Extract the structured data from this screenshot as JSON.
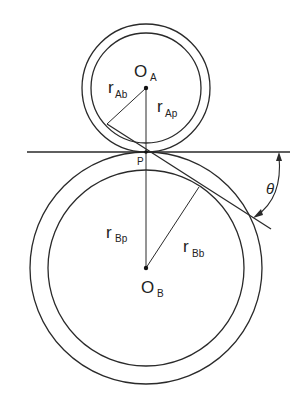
{
  "diagram": {
    "gear_a": {
      "center_label": "O",
      "center_sub": "A",
      "base_radius_label": "r",
      "base_radius_sub": "Ab",
      "pitch_radius_label": "r",
      "pitch_radius_sub": "Ap"
    },
    "gear_b": {
      "center_label": "O",
      "center_sub": "B",
      "base_radius_label": "r",
      "base_radius_sub": "Bb",
      "pitch_radius_label": "r",
      "pitch_radius_sub": "Bp"
    },
    "pitch_point_label": "P",
    "angle_label": "θ",
    "line_color": "#2a2a2a"
  }
}
